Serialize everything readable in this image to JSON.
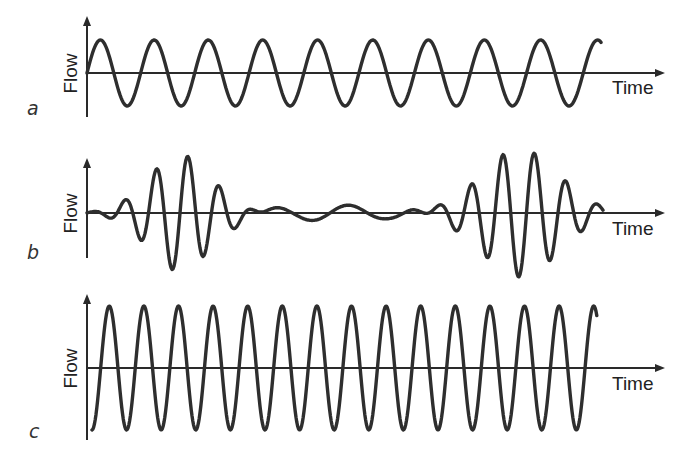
{
  "figure": {
    "panels": [
      {
        "id": "a",
        "letter": "a",
        "ylabel": "Flow",
        "xlabel": "Time",
        "description": "Regular sinusoidal flow of constant amplitude",
        "pattern": "constant",
        "cycles": 10,
        "amplitude_px": 33,
        "layout": {
          "axis_x": 87,
          "axis_top": 18,
          "axis_bottom": 117,
          "baseline": 73,
          "x_end": 663,
          "wave_start": 87,
          "wave_end": 601,
          "start_phase": 0,
          "final_extra": 0.18,
          "letter_pos": [
            26,
            97
          ],
          "flow_pos": [
            52,
            64
          ],
          "time_pos": [
            611,
            78
          ]
        }
      },
      {
        "id": "b",
        "letter": "b",
        "ylabel": "Flow",
        "xlabel": "Time",
        "description": "Waxing and waning flow amplitude (periodic packets separated by low-amplitude interval)",
        "pattern": "waxing-waning",
        "layout": {
          "axis_x": 87,
          "axis_top": 160,
          "axis_bottom": 258,
          "baseline": 213,
          "x_end": 663,
          "letter_pos": [
            26,
            241
          ],
          "flow_pos": [
            52,
            204
          ],
          "time_pos": [
            611,
            219
          ]
        }
      },
      {
        "id": "c",
        "letter": "c",
        "ylabel": "Flow",
        "xlabel": "Time",
        "description": "Regular sinusoidal flow with high constant amplitude",
        "pattern": "constant",
        "cycles": 14,
        "amplitude_px": 62,
        "layout": {
          "axis_x": 87,
          "axis_top": 296,
          "axis_bottom": 440,
          "baseline": 368,
          "x_end": 663,
          "letter_pos": [
            26,
            422
          ],
          "flow_pos": [
            52,
            359
          ],
          "time_pos": [
            611,
            374
          ]
        }
      }
    ],
    "colors": {
      "line": "#2e2e2e",
      "axis": "#2a2a2a",
      "text": "#222222",
      "background": "#ffffff"
    }
  }
}
